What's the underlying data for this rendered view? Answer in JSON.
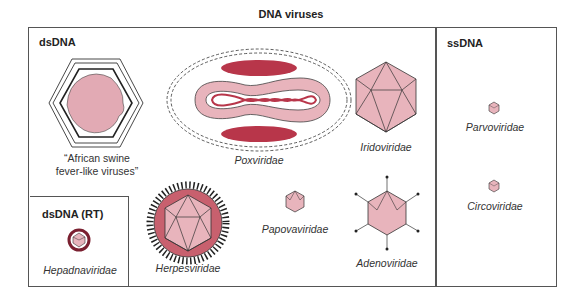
{
  "title": "DNA viruses",
  "colors": {
    "capsid_fill": "#e8b4bc",
    "dark_red": "#b8364a",
    "core_pink": "#e0a0ac",
    "herpes_envelope": "#c8606e",
    "outline": "#333333"
  },
  "groups": {
    "dsdna": {
      "heading": "dsDNA",
      "viruses": [
        {
          "name": "“African swine fever-like viruses”",
          "line1": "“African swine",
          "line2": "fever-like viruses”",
          "italic": false
        },
        {
          "name": "Poxviridae",
          "italic": true
        },
        {
          "name": "Iridoviridae",
          "italic": true
        },
        {
          "name": "Herpesviridae",
          "italic": true
        },
        {
          "name": "Papovaviridae",
          "italic": true
        },
        {
          "name": "Adenoviridae",
          "italic": true
        }
      ]
    },
    "dsdna_rt": {
      "heading": "dsDNA (RT)",
      "viruses": [
        {
          "name": "Hepadnaviridae",
          "italic": true
        }
      ]
    },
    "ssdna": {
      "heading": "ssDNA",
      "viruses": [
        {
          "name": "Parvoviridae",
          "italic": true
        },
        {
          "name": "Circoviridae",
          "italic": true
        }
      ]
    }
  }
}
